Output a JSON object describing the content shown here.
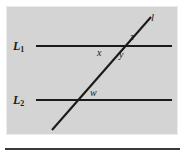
{
  "figure": {
    "type": "geometry-diagram",
    "background_color": "#d4d4d4",
    "line_color": "#1a1a1a",
    "page_rule_color": "#3a3a3a",
    "labels": {
      "line1_name": "L",
      "line1_subscript": "1",
      "line2_name": "L",
      "line2_subscript": "2",
      "transversal_name": "l",
      "angle_x": "x",
      "angle_y": "y",
      "angle_z": "z",
      "angle_w": "w"
    },
    "geometry": {
      "line1": {
        "x1": 36,
        "y1": 46,
        "x2": 172,
        "y2": 46
      },
      "line2": {
        "x1": 36,
        "y1": 100,
        "x2": 172,
        "y2": 100
      },
      "transversal": {
        "x1": 52,
        "y1": 130,
        "x2": 151,
        "y2": 17
      },
      "intersection_line1": {
        "x": 120,
        "y": 46
      },
      "intersection_line2": {
        "x": 76,
        "y": 100
      }
    }
  }
}
